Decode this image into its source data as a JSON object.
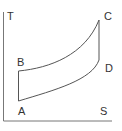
{
  "diagram": {
    "type": "T-S diagram",
    "axes": {
      "y_label": "T",
      "x_label": "S"
    },
    "points": [
      {
        "label": "A",
        "x": 18,
        "y": 101
      },
      {
        "label": "B",
        "x": 18,
        "y": 71
      },
      {
        "label": "C",
        "x": 99,
        "y": 20
      },
      {
        "label": "D",
        "x": 99,
        "y": 62
      }
    ],
    "colors": {
      "line": "#555555",
      "text": "#333333",
      "background": "#ffffff"
    }
  }
}
